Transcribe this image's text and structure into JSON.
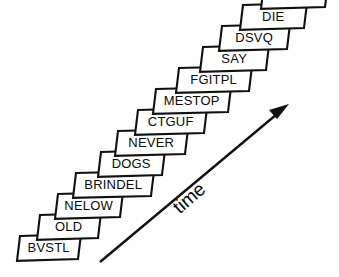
{
  "figure": {
    "title": "",
    "background_color": "#fefefe",
    "line_color": "#111111",
    "box_fill_color": "#ffffff",
    "text_color": "#0a0a0a"
  },
  "chart_data": {
    "type": "diagram",
    "diagram_kind": "ascending-staircase-of-labeled-boxes",
    "title": "",
    "xlabel": "time",
    "ylabel": "",
    "grid": false,
    "legend": null,
    "annotations": [
      {
        "name": "time-arrow",
        "text": "time",
        "direction": "lower-left-to-upper-right",
        "rotation_deg": -41,
        "tail": [
          100,
          262
        ],
        "tip": [
          288,
          105
        ]
      }
    ],
    "categories": [
      "BVSTL",
      "OLD",
      "NELOW",
      "BRINDEL",
      "DOGS",
      "NEVER",
      "CTGUF",
      "MESTOP",
      "FGITPL",
      "SAY",
      "DSVQ",
      "DIE",
      "ZBOT"
    ],
    "values": [
      1,
      2,
      3,
      4,
      5,
      6,
      7,
      8,
      9,
      10,
      11,
      12,
      13
    ],
    "boxes": [
      {
        "label": "BVSTL",
        "step": 1,
        "x": 17,
        "y": 236,
        "w": 61,
        "h": 23,
        "skew": 3
      },
      {
        "label": "OLD",
        "step": 2,
        "x": 37,
        "y": 215,
        "w": 61,
        "h": 23,
        "skew": 3
      },
      {
        "label": "NELOW",
        "step": 3,
        "x": 55,
        "y": 194,
        "w": 65,
        "h": 23,
        "skew": 3
      },
      {
        "label": "BRINDEL",
        "step": 4,
        "x": 73,
        "y": 173,
        "w": 78,
        "h": 23,
        "skew": 3
      },
      {
        "label": "DOGS",
        "step": 5,
        "x": 98,
        "y": 152,
        "w": 64,
        "h": 23,
        "skew": 3
      },
      {
        "label": "NEVER",
        "step": 6,
        "x": 115,
        "y": 131,
        "w": 70,
        "h": 23,
        "skew": 3
      },
      {
        "label": "CTGUF",
        "step": 7,
        "x": 135,
        "y": 110,
        "w": 69,
        "h": 23,
        "skew": 3
      },
      {
        "label": "MESTOP",
        "step": 8,
        "x": 153,
        "y": 89,
        "w": 75,
        "h": 23,
        "skew": 3
      },
      {
        "label": "FGITPL",
        "step": 9,
        "x": 176,
        "y": 68,
        "w": 73,
        "h": 23,
        "skew": 3
      },
      {
        "label": "SAY",
        "step": 10,
        "x": 200,
        "y": 47,
        "w": 66,
        "h": 23,
        "skew": 3
      },
      {
        "label": "DSVQ",
        "step": 11,
        "x": 219,
        "y": 26,
        "w": 68,
        "h": 23,
        "skew": 3
      },
      {
        "label": "DIE",
        "step": 12,
        "x": 240,
        "y": 5,
        "w": 64,
        "h": 23,
        "skew": 3
      },
      {
        "label": "ZBOT",
        "step": 13,
        "x": 261,
        "y": -16,
        "w": 64,
        "h": 23,
        "skew": 3
      }
    ]
  }
}
